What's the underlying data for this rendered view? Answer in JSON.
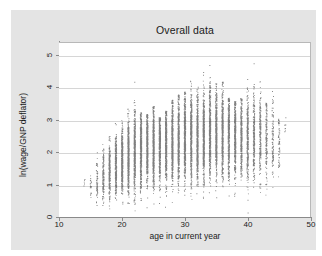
{
  "chart_data": {
    "type": "scatter",
    "title": "Overall data",
    "xlabel": "age in current year",
    "ylabel": "ln(wage/GNP deflator)",
    "xlim": [
      10,
      50
    ],
    "ylim": [
      0,
      5.4
    ],
    "xticks": [
      10,
      20,
      30,
      40,
      50
    ],
    "xtick_labels": [
      "10",
      "20",
      "30",
      "40",
      "50"
    ],
    "yticks": [
      0,
      1,
      2,
      3,
      4,
      5
    ],
    "ytick_labels": [
      "0",
      "1",
      "2",
      "3",
      "4",
      "5"
    ],
    "grid": "horizontal",
    "legend": "none",
    "marker": {
      "shape": "circle",
      "color": "#4d4d4d",
      "size": 0.8
    },
    "age_columns": [
      {
        "age": 14,
        "n": 6,
        "ymin": 0.3,
        "ymax": 1.2,
        "ymed": 1.05,
        "q1": 0.95,
        "q3": 1.15
      },
      {
        "age": 15,
        "n": 22,
        "ymin": 0.1,
        "ymax": 1.75,
        "ymed": 1.05,
        "q1": 0.75,
        "q3": 1.3
      },
      {
        "age": 16,
        "n": 70,
        "ymin": 0.05,
        "ymax": 2.05,
        "ymed": 1.15,
        "q1": 0.8,
        "q3": 1.5
      },
      {
        "age": 17,
        "n": 150,
        "ymin": 0.02,
        "ymax": 2.78,
        "ymed": 1.3,
        "q1": 0.85,
        "q3": 1.75
      },
      {
        "age": 18,
        "n": 260,
        "ymin": 0.0,
        "ymax": 2.55,
        "ymed": 1.45,
        "q1": 0.95,
        "q3": 1.95
      },
      {
        "age": 19,
        "n": 340,
        "ymin": 0.0,
        "ymax": 3.55,
        "ymed": 1.6,
        "q1": 1.05,
        "q3": 2.1
      },
      {
        "age": 20,
        "n": 420,
        "ymin": 0.0,
        "ymax": 3.4,
        "ymed": 1.75,
        "q1": 1.1,
        "q3": 2.3
      },
      {
        "age": 21,
        "n": 470,
        "ymin": 0.0,
        "ymax": 3.75,
        "ymed": 1.9,
        "q1": 1.2,
        "q3": 2.45
      },
      {
        "age": 22,
        "n": 500,
        "ymin": 0.0,
        "ymax": 4.2,
        "ymed": 2.0,
        "q1": 1.25,
        "q3": 2.55
      },
      {
        "age": 23,
        "n": 520,
        "ymin": 0.0,
        "ymax": 3.25,
        "ymed": 2.1,
        "q1": 1.3,
        "q3": 2.65
      },
      {
        "age": 24,
        "n": 530,
        "ymin": 0.0,
        "ymax": 3.2,
        "ymed": 2.15,
        "q1": 1.35,
        "q3": 2.7
      },
      {
        "age": 25,
        "n": 540,
        "ymin": 0.0,
        "ymax": 3.45,
        "ymed": 2.2,
        "q1": 1.4,
        "q3": 2.75
      },
      {
        "age": 26,
        "n": 545,
        "ymin": 0.0,
        "ymax": 3.1,
        "ymed": 2.25,
        "q1": 1.45,
        "q3": 2.8
      },
      {
        "age": 27,
        "n": 550,
        "ymin": 0.0,
        "ymax": 3.3,
        "ymed": 2.3,
        "q1": 1.5,
        "q3": 2.85
      },
      {
        "age": 28,
        "n": 560,
        "ymin": 0.0,
        "ymax": 3.65,
        "ymed": 2.35,
        "q1": 1.5,
        "q3": 2.9
      },
      {
        "age": 29,
        "n": 565,
        "ymin": 0.0,
        "ymax": 3.8,
        "ymed": 2.4,
        "q1": 1.55,
        "q3": 2.95
      },
      {
        "age": 30,
        "n": 575,
        "ymin": 0.0,
        "ymax": 3.9,
        "ymed": 2.45,
        "q1": 1.55,
        "q3": 3.0
      },
      {
        "age": 31,
        "n": 575,
        "ymin": 0.0,
        "ymax": 4.4,
        "ymed": 2.5,
        "q1": 1.6,
        "q3": 3.05
      },
      {
        "age": 32,
        "n": 570,
        "ymin": 0.0,
        "ymax": 4.05,
        "ymed": 2.52,
        "q1": 1.6,
        "q3": 3.1
      },
      {
        "age": 33,
        "n": 560,
        "ymin": 0.0,
        "ymax": 4.5,
        "ymed": 2.55,
        "q1": 1.62,
        "q3": 3.12
      },
      {
        "age": 34,
        "n": 550,
        "ymin": 0.0,
        "ymax": 4.8,
        "ymed": 2.58,
        "q1": 1.65,
        "q3": 3.15
      },
      {
        "age": 35,
        "n": 540,
        "ymin": 0.0,
        "ymax": 4.15,
        "ymed": 2.58,
        "q1": 1.65,
        "q3": 3.15
      },
      {
        "age": 36,
        "n": 520,
        "ymin": 0.0,
        "ymax": 4.2,
        "ymed": 2.58,
        "q1": 1.65,
        "q3": 3.15
      },
      {
        "age": 37,
        "n": 480,
        "ymin": 0.0,
        "ymax": 3.7,
        "ymed": 2.55,
        "q1": 1.62,
        "q3": 3.12
      },
      {
        "age": 38,
        "n": 430,
        "ymin": 0.0,
        "ymax": 3.6,
        "ymed": 2.55,
        "q1": 1.6,
        "q3": 3.1
      },
      {
        "age": 39,
        "n": 380,
        "ymin": 0.0,
        "ymax": 3.7,
        "ymed": 2.52,
        "q1": 1.58,
        "q3": 3.08
      },
      {
        "age": 40,
        "n": 330,
        "ymin": 0.0,
        "ymax": 4.3,
        "ymed": 2.5,
        "q1": 1.55,
        "q3": 3.05
      },
      {
        "age": 41,
        "n": 280,
        "ymin": 0.0,
        "ymax": 5.15,
        "ymed": 2.48,
        "q1": 1.52,
        "q3": 3.02
      },
      {
        "age": 42,
        "n": 220,
        "ymin": 0.0,
        "ymax": 4.3,
        "ymed": 2.45,
        "q1": 1.5,
        "q3": 3.0
      },
      {
        "age": 43,
        "n": 160,
        "ymin": 0.02,
        "ymax": 3.55,
        "ymed": 2.42,
        "q1": 1.48,
        "q3": 2.98
      },
      {
        "age": 44,
        "n": 110,
        "ymin": 0.05,
        "ymax": 3.95,
        "ymed": 2.4,
        "q1": 1.45,
        "q3": 2.95
      },
      {
        "age": 45,
        "n": 60,
        "ymin": 0.35,
        "ymax": 3.05,
        "ymed": 2.3,
        "q1": 1.6,
        "q3": 2.85
      },
      {
        "age": 46,
        "n": 8,
        "ymin": 2.5,
        "ymax": 3.1,
        "ymed": 2.85,
        "q1": 2.7,
        "q3": 3.0
      }
    ]
  },
  "colors": {
    "graph_region": "#e4e4e4",
    "plot_background": "#ffffff",
    "gridline": "#d6d6d6",
    "axis": "#8a8a8a",
    "marker": "#4d4d4d",
    "text": "#1a1a1a"
  }
}
